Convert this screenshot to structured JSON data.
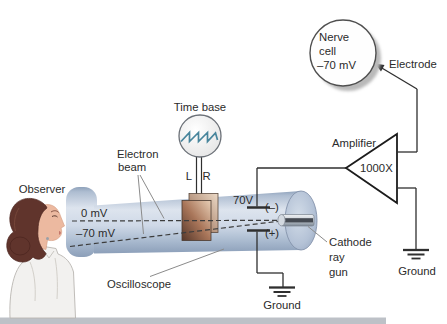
{
  "figure": {
    "observer_label": "Observer",
    "oscilloscope_label": "Oscilloscope",
    "electron_beam": {
      "line1": "Electron",
      "line2": "beam"
    },
    "time_base_label": "Time base",
    "plate_l": "L",
    "plate_r": "R",
    "trace_zero_label": "0 mV",
    "trace_rest_label": "–70 mV",
    "voltage_label": "70V",
    "minus_label": "(–)",
    "plus_label": "(+)",
    "cathode_ray_gun": {
      "line1": "Cathode",
      "line2": "ray",
      "line3": "gun"
    },
    "ground_bottom_label": "Ground",
    "ground_right_label": "Ground",
    "amplifier_label": "Amplifier",
    "gain_label": "1000X",
    "electrode_label": "Electrode",
    "nerve_cell": {
      "line1": "Nerve",
      "line2": "cell",
      "line3": "–70 mV"
    },
    "colors": {
      "tube_blue": "#c3cfdf",
      "tube_shadow": "#8c9fb9",
      "plate_copper": "#9a6a4e",
      "sawtooth_teal": "#47859c",
      "wire": "#2f2f2f",
      "pointer_gray": "#8b8b8b",
      "hair_brown": "#5e332b",
      "skin": "#ecb9a0",
      "coat_white": "#f2f1ef",
      "background": "#ffffff"
    }
  }
}
